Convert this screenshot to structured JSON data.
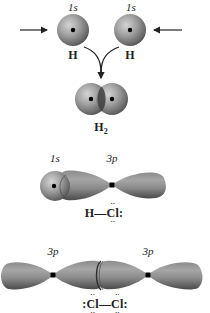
{
  "diagram": {
    "h2_panel": {
      "left_orbital_label": "1s",
      "right_orbital_label": "1s",
      "left_atom_label": "H",
      "right_atom_label": "H",
      "product_label": "H",
      "product_subscript": "2",
      "arrows": [
        "left-arrow-incoming",
        "right-arrow-incoming",
        "converging-curved-arrow"
      ]
    },
    "hcl_panel": {
      "h_orbital_label": "1s",
      "cl_orbital_label": "3p",
      "lewis_h": "H",
      "lewis_bond": "—",
      "lewis_cl": "Cl",
      "lewis_cl_top_dots": "··",
      "lewis_cl_bottom_dots": "··",
      "lewis_cl_right_dots": ":"
    },
    "cl2_panel": {
      "left_orbital_label": "3p",
      "right_orbital_label": "3p",
      "lewis_left_dots": ":",
      "lewis_cl1": "Cl",
      "lewis_bond": "—",
      "lewis_cl2": "Cl",
      "lewis_right_dots": ":",
      "lewis_top_dots": "··",
      "lewis_bottom_dots": "··"
    },
    "colors": {
      "orbital_light": "#b8b8b8",
      "orbital_mid": "#8a8a8a",
      "orbital_dark": "#4a4a4a",
      "nucleus": "#000000",
      "arrow": "#222222"
    }
  }
}
